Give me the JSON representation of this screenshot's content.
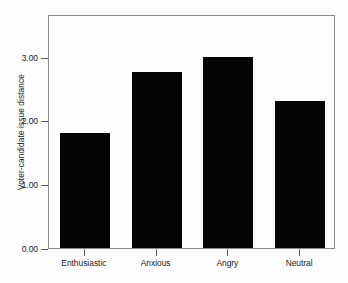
{
  "chart_data": {
    "type": "bar",
    "title": "",
    "xlabel": "",
    "ylabel": "Voter-candidate issue distance",
    "categories": [
      "Enthusiastic",
      "Anxious",
      "Angry",
      "Neutral"
    ],
    "values": [
      1.81,
      2.76,
      3.0,
      2.31
    ],
    "ylim": [
      0.0,
      3.67
    ],
    "yticks": [
      0.0,
      1.0,
      2.0,
      3.0
    ],
    "ytick_labels": [
      "0.00",
      "1.00",
      "2.00",
      "3.00"
    ],
    "grid": false,
    "legend": null,
    "bar_color": "#050505",
    "frame_color": "#8a8a8a",
    "background_color": "#fdfdfd"
  }
}
